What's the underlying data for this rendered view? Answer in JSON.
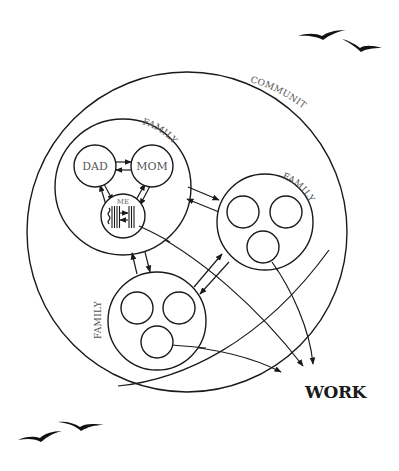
{
  "diagram": {
    "colors": {
      "line": "#1a1a1a",
      "label": "#555555",
      "background": "#ffffff"
    },
    "community": {
      "label": "COMMUNITY",
      "cx": 187,
      "cy": 232,
      "r": 160
    },
    "families": [
      {
        "id": "family-1",
        "label": "FAMILY",
        "cx": 123,
        "cy": 187,
        "r": 68,
        "members": [
          {
            "id": "dad",
            "label": "DAD",
            "cx": 95,
            "cy": 166,
            "r": 21
          },
          {
            "id": "mom",
            "label": "MOM",
            "cx": 152,
            "cy": 166,
            "r": 21
          },
          {
            "id": "me",
            "label": "ME",
            "cx": 123,
            "cy": 216,
            "r": 22
          }
        ]
      },
      {
        "id": "family-2",
        "label": "FAMILY",
        "cx": 265,
        "cy": 222,
        "r": 48,
        "members": [
          {
            "id": "f2-m1",
            "label": "",
            "cx": 243,
            "cy": 212,
            "r": 16
          },
          {
            "id": "f2-m2",
            "label": "",
            "cx": 286,
            "cy": 212,
            "r": 16
          },
          {
            "id": "f2-m3",
            "label": "",
            "cx": 263,
            "cy": 247,
            "r": 16
          }
        ]
      },
      {
        "id": "family-3",
        "label": "FAMILY",
        "cx": 157,
        "cy": 321,
        "r": 49,
        "members": [
          {
            "id": "f3-m1",
            "label": "",
            "cx": 137,
            "cy": 308,
            "r": 16
          },
          {
            "id": "f3-m2",
            "label": "",
            "cx": 179,
            "cy": 308,
            "r": 16
          },
          {
            "id": "f3-m3",
            "label": "",
            "cx": 157,
            "cy": 342,
            "r": 16
          }
        ]
      }
    ],
    "work": {
      "label": "WORK",
      "x": 305,
      "y": 398
    },
    "connections": [
      {
        "from": "dad",
        "to": "mom",
        "type": "bidirectional"
      },
      {
        "from": "dad",
        "to": "me",
        "type": "bidirectional"
      },
      {
        "from": "mom",
        "to": "me",
        "type": "bidirectional"
      },
      {
        "from": "family-1",
        "to": "family-2",
        "type": "bidirectional"
      },
      {
        "from": "family-1",
        "to": "family-3",
        "type": "bidirectional"
      },
      {
        "from": "family-2",
        "to": "family-3",
        "type": "bidirectional"
      },
      {
        "from": "me",
        "to": "work",
        "type": "directed"
      },
      {
        "from": "f2-m3",
        "to": "work",
        "type": "directed"
      },
      {
        "from": "f3-m3",
        "to": "work",
        "type": "directed"
      },
      {
        "from": "family-3",
        "to": "work",
        "type": "directed"
      }
    ],
    "decorations": [
      {
        "id": "birds-top-right",
        "icon": "birds-icon"
      },
      {
        "id": "birds-bottom-left",
        "icon": "birds-icon"
      }
    ]
  }
}
